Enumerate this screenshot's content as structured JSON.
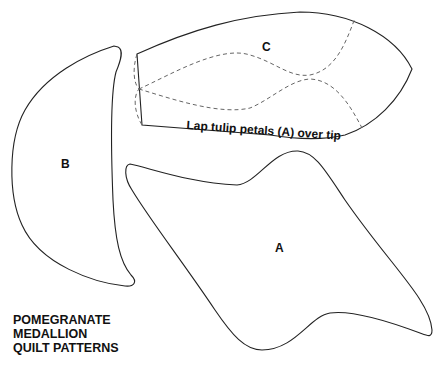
{
  "diagram": {
    "title_lines": [
      "POMEGRANATE",
      "MEDALLION",
      "QUILT PATTERNS"
    ],
    "pieces": [
      {
        "id": "A",
        "label": "A"
      },
      {
        "id": "B",
        "label": "B"
      },
      {
        "id": "C",
        "label": "C",
        "note": "Lap tulip petals (A) over tip"
      }
    ],
    "colors": {
      "outline": "#222222",
      "dashed": "#555555",
      "background": "#ffffff"
    }
  }
}
